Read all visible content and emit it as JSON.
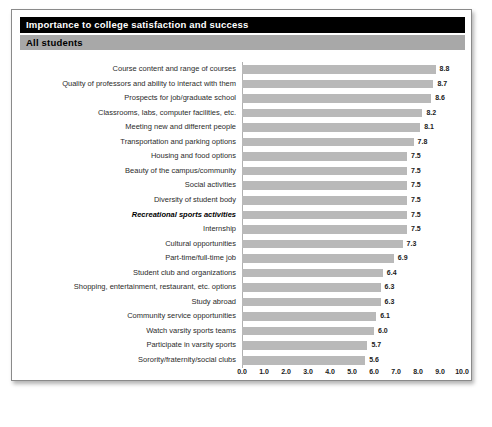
{
  "header": {
    "title": "Importance to college satisfaction and success",
    "subtitle": "All students"
  },
  "chart_data": {
    "type": "bar",
    "orientation": "horizontal",
    "title": "Importance to college satisfaction and success",
    "subtitle": "All students",
    "xlabel": "",
    "ylabel": "",
    "xlim": [
      0.0,
      10.0
    ],
    "xticks": [
      "0.0",
      "1.0",
      "2.0",
      "3.0",
      "4.0",
      "5.0",
      "6.0",
      "7.0",
      "8.0",
      "9.0",
      "10.0"
    ],
    "grid": true,
    "legend": false,
    "bar_color": "#b9b9b9",
    "highlight_index": 10,
    "categories": [
      "Course content and range of courses",
      "Quality of professors and ability to interact with them",
      "Prospects for job/graduate school",
      "Classrooms, labs, computer facilities, etc.",
      "Meeting new and different people",
      "Transportation and parking options",
      "Housing and food options",
      "Beauty of the campus/community",
      "Social activities",
      "Diversity of student body",
      "Recreational sports activities",
      "Internship",
      "Cultural opportunities",
      "Part-time/full-time job",
      "Student club and organizations",
      "Shopping, entertainment, restaurant, etc. options",
      "Study abroad",
      "Community service opportunities",
      "Watch varsity sports teams",
      "Participate in varsity sports",
      "Sorority/fraternity/social clubs"
    ],
    "values": [
      8.8,
      8.7,
      8.6,
      8.2,
      8.1,
      7.8,
      7.5,
      7.5,
      7.5,
      7.5,
      7.5,
      7.5,
      7.3,
      6.9,
      6.4,
      6.3,
      6.3,
      6.1,
      6.0,
      5.7,
      5.6
    ],
    "value_labels": [
      "8.8",
      "8.7",
      "8.6",
      "8.2",
      "8.1",
      "7.8",
      "7.5",
      "7.5",
      "7.5",
      "7.5",
      "7.5",
      "7.5",
      "7.3",
      "6.9",
      "6.4",
      "6.3",
      "6.3",
      "6.1",
      "6.0",
      "5.7",
      "5.6"
    ]
  }
}
